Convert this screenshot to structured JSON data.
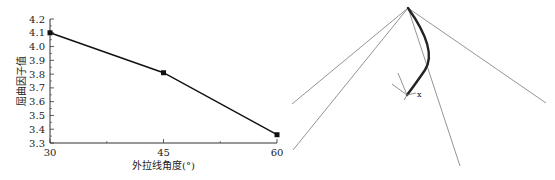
{
  "chart_data": {
    "type": "line",
    "title": "",
    "xlabel": "外拉线角度(°)",
    "ylabel": "屈曲因子值",
    "x": [
      30,
      45,
      60
    ],
    "series": [
      {
        "name": "屈曲因子值",
        "values": [
          4.1,
          3.81,
          3.36
        ]
      }
    ],
    "xticks": [
      "30",
      "45",
      "60"
    ],
    "yticks": [
      "3.3",
      "3.4",
      "3.5",
      "3.6",
      "3.7",
      "3.8",
      "3.9",
      "4.0",
      "4.1",
      "4.2"
    ],
    "xlim": [
      30,
      60
    ],
    "ylim": [
      3.3,
      4.2
    ],
    "grid": false,
    "marker": "square",
    "legend": null
  },
  "diagram": {
    "axis_label": "x"
  }
}
